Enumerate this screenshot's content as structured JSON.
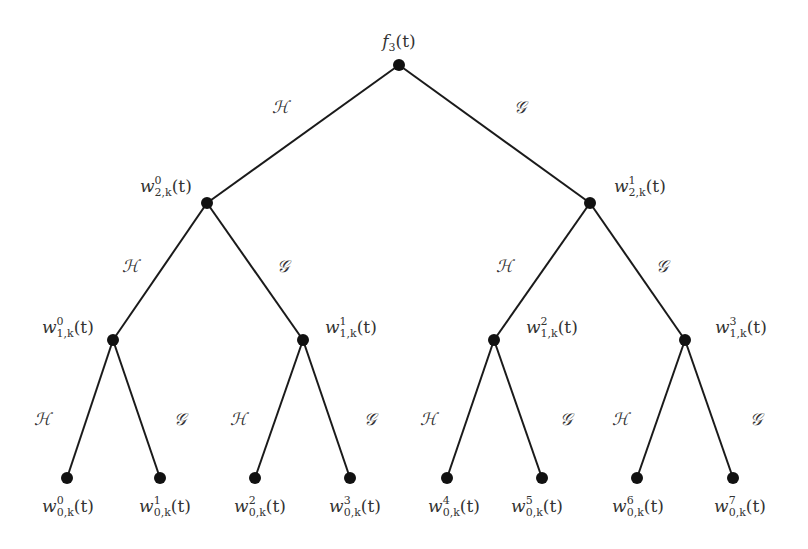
{
  "diagram": {
    "type": "binary-tree",
    "root": {
      "id": "root",
      "label": "f",
      "sub": "3",
      "sup": "",
      "arg": "(t)",
      "x": 399,
      "y": 65,
      "label_x": 399,
      "label_y": 47,
      "anchor": "middle"
    },
    "nodes": [
      {
        "id": "w2_0",
        "label": "w",
        "sup": "0",
        "sub": "2,k",
        "arg": "(t)",
        "x": 207,
        "y": 203,
        "label_x": 140,
        "label_y": 192,
        "anchor": "start"
      },
      {
        "id": "w2_1",
        "label": "w",
        "sup": "1",
        "sub": "2,k",
        "arg": "(t)",
        "x": 590,
        "y": 203,
        "label_x": 614,
        "label_y": 192,
        "anchor": "start"
      },
      {
        "id": "w1_0",
        "label": "w",
        "sup": "0",
        "sub": "1,k",
        "arg": "(t)",
        "x": 113,
        "y": 340,
        "label_x": 42,
        "label_y": 333,
        "anchor": "start"
      },
      {
        "id": "w1_1",
        "label": "w",
        "sup": "1",
        "sub": "1,k",
        "arg": "(t)",
        "x": 303,
        "y": 340,
        "label_x": 325,
        "label_y": 333,
        "anchor": "start"
      },
      {
        "id": "w1_2",
        "label": "w",
        "sup": "2",
        "sub": "1,k",
        "arg": "(t)",
        "x": 494,
        "y": 340,
        "label_x": 526,
        "label_y": 333,
        "anchor": "start"
      },
      {
        "id": "w1_3",
        "label": "w",
        "sup": "3",
        "sub": "1,k",
        "arg": "(t)",
        "x": 685,
        "y": 340,
        "label_x": 715,
        "label_y": 333,
        "anchor": "start"
      },
      {
        "id": "w0_0",
        "label": "w",
        "sup": "0",
        "sub": "0,k",
        "arg": "(t)",
        "x": 67,
        "y": 478,
        "label_x": 68,
        "label_y": 512,
        "anchor": "middle"
      },
      {
        "id": "w0_1",
        "label": "w",
        "sup": "1",
        "sub": "0,k",
        "arg": "(t)",
        "x": 160,
        "y": 478,
        "label_x": 165,
        "label_y": 512,
        "anchor": "middle"
      },
      {
        "id": "w0_2",
        "label": "w",
        "sup": "2",
        "sub": "0,k",
        "arg": "(t)",
        "x": 255,
        "y": 478,
        "label_x": 260,
        "label_y": 512,
        "anchor": "middle"
      },
      {
        "id": "w0_3",
        "label": "w",
        "sup": "3",
        "sub": "0,k",
        "arg": "(t)",
        "x": 350,
        "y": 478,
        "label_x": 355,
        "label_y": 512,
        "anchor": "middle"
      },
      {
        "id": "w0_4",
        "label": "w",
        "sup": "4",
        "sub": "0,k",
        "arg": "(t)",
        "x": 447,
        "y": 478,
        "label_x": 454,
        "label_y": 512,
        "anchor": "middle"
      },
      {
        "id": "w0_5",
        "label": "w",
        "sup": "5",
        "sub": "0,k",
        "arg": "(t)",
        "x": 542,
        "y": 478,
        "label_x": 537,
        "label_y": 512,
        "anchor": "middle"
      },
      {
        "id": "w0_6",
        "label": "w",
        "sup": "6",
        "sub": "0,k",
        "arg": "(t)",
        "x": 637,
        "y": 478,
        "label_x": 638,
        "label_y": 512,
        "anchor": "middle"
      },
      {
        "id": "w0_7",
        "label": "w",
        "sup": "7",
        "sub": "0,k",
        "arg": "(t)",
        "x": 733,
        "y": 478,
        "label_x": 740,
        "label_y": 512,
        "anchor": "middle"
      }
    ],
    "edges": [
      {
        "from": "root",
        "to": "w2_0",
        "filter": "H",
        "label_x": 280,
        "label_y": 113
      },
      {
        "from": "root",
        "to": "w2_1",
        "filter": "G",
        "label_x": 520,
        "label_y": 113
      },
      {
        "from": "w2_0",
        "to": "w1_0",
        "filter": "H",
        "label_x": 130,
        "label_y": 272
      },
      {
        "from": "w2_0",
        "to": "w1_1",
        "filter": "G",
        "label_x": 283,
        "label_y": 272
      },
      {
        "from": "w2_1",
        "to": "w1_2",
        "filter": "H",
        "label_x": 504,
        "label_y": 272
      },
      {
        "from": "w2_1",
        "to": "w1_3",
        "filter": "G",
        "label_x": 662,
        "label_y": 272
      },
      {
        "from": "w1_0",
        "to": "w0_0",
        "filter": "H",
        "label_x": 42,
        "label_y": 425
      },
      {
        "from": "w1_0",
        "to": "w0_1",
        "filter": "G",
        "label_x": 180,
        "label_y": 425
      },
      {
        "from": "w1_1",
        "to": "w0_2",
        "filter": "H",
        "label_x": 238,
        "label_y": 425
      },
      {
        "from": "w1_1",
        "to": "w0_3",
        "filter": "G",
        "label_x": 370,
        "label_y": 425
      },
      {
        "from": "w1_2",
        "to": "w0_4",
        "filter": "H",
        "label_x": 428,
        "label_y": 425
      },
      {
        "from": "w1_2",
        "to": "w0_5",
        "filter": "G",
        "label_x": 566,
        "label_y": 425
      },
      {
        "from": "w1_3",
        "to": "w0_6",
        "filter": "H",
        "label_x": 620,
        "label_y": 425
      },
      {
        "from": "w1_3",
        "to": "w0_7",
        "filter": "G",
        "label_x": 756,
        "label_y": 425
      }
    ],
    "filter_symbols": {
      "H": "ℋ",
      "G": "𝒢"
    },
    "colors": {
      "edge": "#1a1a1a",
      "node": "#111111",
      "text": "#333333",
      "background": "#ffffff"
    },
    "node_radius": 6
  }
}
